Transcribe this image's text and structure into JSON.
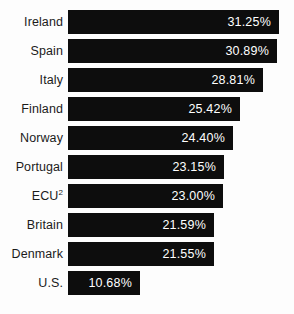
{
  "chart_data": {
    "type": "bar",
    "orientation": "horizontal",
    "title": "",
    "subtitle": "",
    "xlabel": "",
    "ylabel": "",
    "grid": false,
    "legend": null,
    "axis_visible": false,
    "xlim": [
      0,
      33
    ],
    "value_suffix": "%",
    "categories": [
      "Ireland",
      "Spain",
      "Italy",
      "Finland",
      "Norway",
      "Portugal",
      "ECU²",
      "Britain",
      "Denmark",
      "U.S."
    ],
    "values": [
      31.25,
      30.89,
      28.81,
      25.42,
      24.4,
      23.15,
      23.0,
      21.59,
      21.55,
      10.68
    ],
    "value_labels": [
      "31.25%",
      "30.89%",
      "28.81%",
      "25.42%",
      "24.40%",
      "23.15%",
      "23.00%",
      "21.59%",
      "21.55%",
      "10.68%"
    ],
    "bar_color": "#0d0d0d",
    "label_color": "#1b1b1b",
    "value_text_color": "#ffffff",
    "background_color": "#fdfdfd"
  },
  "rows": [
    {
      "label": "Ireland",
      "label_html": "Ireland",
      "value": 31.25,
      "value_label": "31.25%"
    },
    {
      "label": "Spain",
      "label_html": "Spain",
      "value": 30.89,
      "value_label": "30.89%"
    },
    {
      "label": "Italy",
      "label_html": "Italy",
      "value": 28.81,
      "value_label": "28.81%"
    },
    {
      "label": "Finland",
      "label_html": "Finland",
      "value": 25.42,
      "value_label": "25.42%"
    },
    {
      "label": "Norway",
      "label_html": "Norway",
      "value": 24.4,
      "value_label": "24.40%"
    },
    {
      "label": "Portugal",
      "label_html": "Portugal",
      "value": 23.15,
      "value_label": "23.15%"
    },
    {
      "label": "ECU2",
      "label_html": "ECU<sup>2</sup>",
      "value": 23.0,
      "value_label": "23.00%"
    },
    {
      "label": "Britain",
      "label_html": "Britain",
      "value": 21.59,
      "value_label": "21.59%"
    },
    {
      "label": "Denmark",
      "label_html": "Denmark",
      "value": 21.55,
      "value_label": "21.55%"
    },
    {
      "label": "U.S.",
      "label_html": "U.S.",
      "value": 10.68,
      "value_label": "10.68%"
    }
  ],
  "layout": {
    "row_top_start": 10,
    "row_pitch": 29,
    "bar_height": 24,
    "bar_left": 72,
    "max_bar_right": 283
  }
}
